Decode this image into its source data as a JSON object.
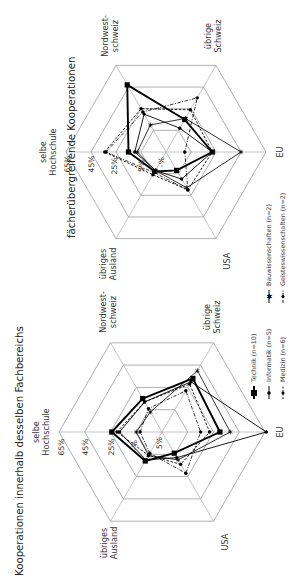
{
  "chart_data": [
    {
      "type": "radar",
      "title": "Kooperationen innerhalb desselben Fachbereichs",
      "axes": [
        "selbe Hochschule",
        "Nordwest-schweiz",
        "übrige Schweiz",
        "EU",
        "USA",
        "übriges Ausland"
      ],
      "rings": [
        "5%",
        "25%",
        "45%",
        "65%"
      ],
      "range": [
        -15,
        65
      ],
      "series": [
        {
          "name": "Technik (n=10)",
          "style": "thick-square",
          "values": [
            24,
            15,
            33,
            30,
            4,
            11
          ]
        },
        {
          "name": "Informatik (n=5)",
          "style": "solid-dot",
          "values": [
            18,
            12,
            30,
            66,
            8,
            10
          ]
        },
        {
          "name": "Medizin (n=6)",
          "style": "dashed-dot",
          "values": [
            20,
            12,
            28,
            22,
            14,
            6
          ]
        },
        {
          "name": "Bauwissenschaften (n=2)",
          "style": "solid-star",
          "values": [
            5,
            3,
            40,
            38,
            10,
            6
          ]
        },
        {
          "name": "Geisteswissenschaften (n=2)",
          "style": "dashdot-dot",
          "values": [
            2,
            6,
            22,
            15,
            22,
            4
          ]
        }
      ]
    },
    {
      "type": "radar",
      "title": "fächerübergreifende Kooperationen",
      "axes": [
        "selbe Hochschule",
        "Nordwest-schweiz",
        "übrige Schweiz",
        "EU",
        "USA",
        "übriges Ausland"
      ],
      "rings": [
        "5%",
        "25%",
        "45%",
        "65%"
      ],
      "range": [
        -15,
        65
      ],
      "series": [
        {
          "name": "Technik (n=10)",
          "style": "thick-square",
          "values": [
            15,
            47,
            15,
            22,
            2,
            3
          ]
        },
        {
          "name": "Informatik (n=5)",
          "style": "solid-dot",
          "values": [
            10,
            20,
            7,
            22,
            10,
            2
          ]
        },
        {
          "name": "Medizin (n=6)",
          "style": "dashed-dot",
          "values": [
            34,
            25,
            24,
            22,
            20,
            6
          ]
        },
        {
          "name": "Bauwissenschaften (n=2)",
          "style": "solid-star",
          "values": [
            8,
            10,
            16,
            45,
            18,
            2
          ]
        },
        {
          "name": "Geisteswissenschaften (n=2)",
          "style": "dashdot-dot",
          "values": [
            33,
            22,
            35,
            0,
            20,
            4
          ]
        }
      ]
    }
  ],
  "charts": {
    "bottom": {
      "title": "Kooperationen innerhalb desselben Fachbereichs",
      "axis_labels": {
        "selbe_1": "selbe",
        "selbe_2": "Hochschule",
        "nw_1": "Nordwest-",
        "nw_2": "schweiz",
        "us_1": "übrige",
        "us_2": "Schweiz",
        "eu": "EU",
        "usa": "USA",
        "ua_1": "übriges",
        "ua_2": "Ausland"
      },
      "ticks": {
        "t65": "65%",
        "t45": "45%",
        "t25": "25%",
        "t5": "5%",
        "tneg": "-%"
      }
    },
    "top": {
      "title": "fächerübergreifende Kooperationen",
      "axis_labels": {
        "selbe_1": "selbe",
        "selbe_2": "Hochschule",
        "nw_1": "Nordwest-",
        "nw_2": "schweiz",
        "us_1": "übrige",
        "us_2": "Schweiz",
        "eu": "EU",
        "usa": "USA",
        "ua_1": "übriges",
        "ua_2": "Ausland"
      },
      "ticks": {
        "t65": "65%",
        "t45": "45%",
        "t25": "25%",
        "t5": "5%",
        "tneg": "-%"
      }
    }
  },
  "legend": {
    "technik": "Technik (n=10)",
    "informatik": "Informatik (n=5)",
    "medizin": "Medizin (n=6)",
    "bau": "Bauwissenschaften (n=2)",
    "geistes": "Geisteswissenschaften (n=2)"
  }
}
